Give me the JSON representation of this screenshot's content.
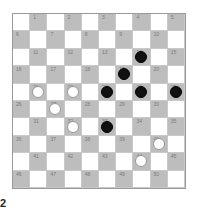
{
  "board": {
    "size": 10,
    "colors": {
      "light": "#ffffff",
      "dark": "#bdbdbd",
      "white_piece": "#ffffff",
      "black_piece": "#111111"
    },
    "pieces": {
      "14": "black",
      "19": "black",
      "21": "white",
      "22": "white",
      "23": "black",
      "24": "black",
      "25": "black",
      "27": "white",
      "32": "white",
      "33": "black",
      "40": "white",
      "44": "white"
    }
  },
  "side_label": "2"
}
